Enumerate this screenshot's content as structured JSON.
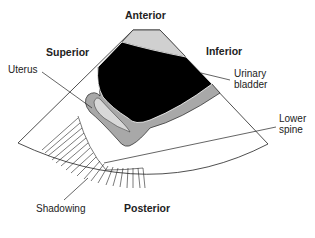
{
  "diagram": {
    "type": "ultrasound-sagittal-view-schematic",
    "orientation_labels": {
      "top": "Anterior",
      "left": "Superior",
      "right": "Inferior",
      "bottom": "Posterior"
    },
    "structure_labels": {
      "uterus": "Uterus",
      "bladder_line1": "Urinary",
      "bladder_line2": "bladder",
      "spine_line1": "Lower",
      "spine_line2": "spine",
      "shadowing": "Shadowing"
    },
    "colors": {
      "bladder": "#000000",
      "tissue_gray": "#a8a8a8",
      "light_gray": "#d0d0d0",
      "outline": "#222222",
      "background": "#ffffff"
    }
  }
}
